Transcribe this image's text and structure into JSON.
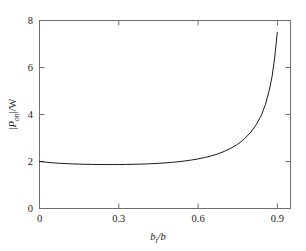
{
  "figure": {
    "background_color": "#ffffff",
    "frame_color": "#6e6e6e",
    "curve_color": "#1a1a1a",
    "text_color": "#1a1a1a"
  },
  "chart_data": {
    "type": "line",
    "title": "",
    "xlabel": "b_i/b",
    "xlabel_base": "b",
    "xlabel_sub": "i",
    "xlabel_tail": "/b",
    "ylabel": "|P_on|/W",
    "ylabel_abs_open": "|",
    "ylabel_base": "P",
    "ylabel_sub": "on",
    "ylabel_tail": "|/W",
    "xlim": [
      0,
      0.95
    ],
    "ylim": [
      0,
      8
    ],
    "xticks": [
      0,
      0.3,
      0.6,
      0.9
    ],
    "xticklabels": [
      "0",
      "0.3",
      "0.6",
      "0.9"
    ],
    "yticks": [
      0,
      2,
      4,
      6,
      8
    ],
    "yticklabels": [
      "0",
      "2",
      "4",
      "6",
      "8"
    ],
    "grid": false,
    "legend": null,
    "series": [
      {
        "name": "normalized on-state power",
        "x": [
          0.0,
          0.025,
          0.05,
          0.075,
          0.1,
          0.125,
          0.15,
          0.175,
          0.2,
          0.225,
          0.25,
          0.275,
          0.3,
          0.325,
          0.35,
          0.375,
          0.4,
          0.425,
          0.45,
          0.475,
          0.5,
          0.525,
          0.55,
          0.575,
          0.6,
          0.625,
          0.65,
          0.675,
          0.7,
          0.725,
          0.75,
          0.775,
          0.8,
          0.82,
          0.84,
          0.855,
          0.87,
          0.88,
          0.89,
          0.895,
          0.9
        ],
        "y": [
          2.0,
          1.97,
          1.945,
          1.925,
          1.91,
          1.898,
          1.888,
          1.881,
          1.876,
          1.872,
          1.87,
          1.87,
          1.871,
          1.874,
          1.879,
          1.886,
          1.895,
          1.907,
          1.922,
          1.94,
          1.962,
          1.99,
          2.023,
          2.063,
          2.11,
          2.168,
          2.238,
          2.325,
          2.432,
          2.566,
          2.735,
          2.955,
          3.25,
          3.56,
          3.98,
          4.42,
          5.05,
          5.6,
          6.4,
          6.95,
          7.5
        ]
      }
    ]
  },
  "axes": {
    "ticks_direction": "in",
    "box": true
  }
}
